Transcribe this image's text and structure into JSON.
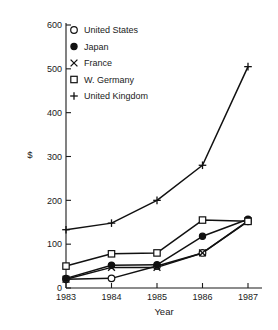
{
  "chart_data": {
    "type": "line",
    "title": "",
    "subtitle": "",
    "xlabel": "Year",
    "ylabel": "$",
    "x": [
      1983,
      1984,
      1985,
      1986,
      1987
    ],
    "categories": [
      "1983",
      "1984",
      "1985",
      "1986",
      "1987"
    ],
    "xtick_labels": [
      "1983",
      "1984",
      "1985",
      "1986",
      "1987"
    ],
    "ytick_labels": [
      "0",
      "100",
      "200",
      "300",
      "400",
      "500",
      "600"
    ],
    "ytick_values": [
      0,
      100,
      200,
      300,
      400,
      500,
      600
    ],
    "ylim": [
      0,
      600
    ],
    "xlim": [
      1983,
      1987
    ],
    "grid": false,
    "legend_position": "upper-left-inside",
    "series": [
      {
        "name": "United States",
        "marker": "open-circle",
        "values": [
          20,
          22,
          50,
          80,
          152
        ]
      },
      {
        "name": "Japan",
        "marker": "filled-circle",
        "values": [
          22,
          52,
          53,
          118,
          157
        ]
      },
      {
        "name": "France",
        "marker": "cross-x",
        "values": [
          20,
          47,
          47,
          80,
          153
        ]
      },
      {
        "name": "W. Germany",
        "marker": "open-square",
        "values": [
          50,
          78,
          80,
          155,
          152
        ]
      },
      {
        "name": "United Kingdom",
        "marker": "plus",
        "values": [
          133,
          148,
          200,
          280,
          505
        ]
      }
    ]
  },
  "legend": {
    "entries": [
      {
        "label": "United States",
        "marker": "open-circle"
      },
      {
        "label": "Japan",
        "marker": "filled-circle"
      },
      {
        "label": "France",
        "marker": "cross-x"
      },
      {
        "label": "W. Germany",
        "marker": "open-square"
      },
      {
        "label": "United Kingdom",
        "marker": "plus"
      }
    ]
  },
  "colors": {
    "ink": "#111111",
    "background": "#ffffff"
  }
}
